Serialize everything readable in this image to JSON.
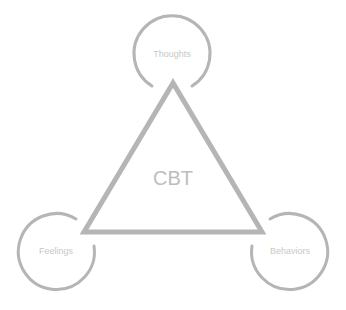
{
  "diagram": {
    "title": "CBT",
    "colors": {
      "stroke": "#b5b5b5",
      "label": "#c8c8c8",
      "center_label": "#bdbdbd",
      "background": "#ffffff"
    },
    "triangle": {
      "vertices": [
        [
          173,
          83
        ],
        [
          84,
          232
        ],
        [
          262,
          232
        ]
      ],
      "stroke_width": 5
    },
    "nodes": [
      {
        "id": "thoughts",
        "label": "Thoughts",
        "cx": 172,
        "cy": 54,
        "r": 38
      },
      {
        "id": "feelings",
        "label": "Feelings",
        "cx": 56,
        "cy": 251,
        "r": 38
      },
      {
        "id": "behaviors",
        "label": "Behaviors",
        "cx": 290,
        "cy": 251,
        "r": 38
      }
    ]
  }
}
